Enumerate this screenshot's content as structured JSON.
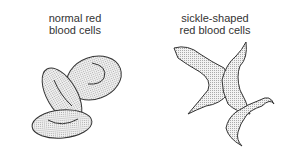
{
  "labels": {
    "normal_line1": "normal red",
    "normal_line2": "blood cells",
    "sickle_line1": "sickle-shaped",
    "sickle_line2": "red blood cells"
  },
  "colors": {
    "stroke": "#333333",
    "fill": "#e6e6e6",
    "text": "#333333"
  }
}
